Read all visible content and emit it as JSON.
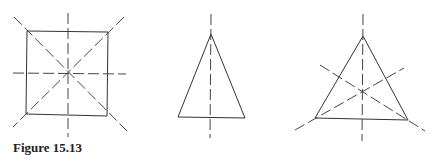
{
  "figure": {
    "caption": "Figure 15.13",
    "shapes": [
      {
        "name": "square",
        "symmetry_axes": 4
      },
      {
        "name": "isosceles-triangle",
        "symmetry_axes": 1
      },
      {
        "name": "equilateral-triangle",
        "symmetry_axes": 3
      }
    ],
    "colors": {
      "stroke": "#333333",
      "background": "#ffffff"
    }
  }
}
